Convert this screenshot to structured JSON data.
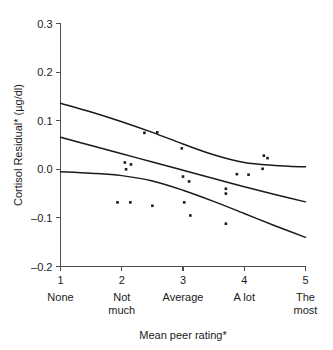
{
  "chart_data": {
    "type": "scatter",
    "title": "",
    "xlabel": "Mean peer rating*",
    "ylabel": "Cortisol Residual* (µg/dl)",
    "xlim": [
      1,
      5
    ],
    "ylim": [
      -0.2,
      0.3
    ],
    "grid": false,
    "legend": "none",
    "x_tick_values": [
      1,
      2,
      3,
      4,
      5
    ],
    "x_tick_labels": [
      "1",
      "2",
      "3",
      "4",
      "5"
    ],
    "x_category_labels": [
      {
        "value": 1,
        "line1": "None",
        "line2": ""
      },
      {
        "value": 2,
        "line1": "Not",
        "line2": "much"
      },
      {
        "value": 3,
        "line1": "Average",
        "line2": ""
      },
      {
        "value": 4,
        "line1": "A lot",
        "line2": ""
      },
      {
        "value": 5,
        "line1": "The",
        "line2": "most"
      }
    ],
    "y_tick_values": [
      -0.2,
      -0.1,
      0.0,
      0.1,
      0.2,
      0.3
    ],
    "y_tick_labels": [
      "–0.2",
      "–0.1",
      "0.0",
      "0.1",
      "0.2",
      "0.3"
    ],
    "points": [
      {
        "x": 1.93,
        "y": -0.068
      },
      {
        "x": 2.05,
        "y": 0.014
      },
      {
        "x": 2.07,
        "y": 0.0
      },
      {
        "x": 2.15,
        "y": 0.01
      },
      {
        "x": 2.14,
        "y": -0.068
      },
      {
        "x": 2.37,
        "y": 0.075
      },
      {
        "x": 2.5,
        "y": -0.075
      },
      {
        "x": 2.58,
        "y": 0.076
      },
      {
        "x": 2.98,
        "y": 0.043
      },
      {
        "x": 3.0,
        "y": -0.015
      },
      {
        "x": 3.02,
        "y": -0.068
      },
      {
        "x": 3.1,
        "y": -0.025
      },
      {
        "x": 3.12,
        "y": -0.095
      },
      {
        "x": 3.7,
        "y": -0.04
      },
      {
        "x": 3.7,
        "y": -0.05
      },
      {
        "x": 3.7,
        "y": -0.112
      },
      {
        "x": 3.88,
        "y": -0.01
      },
      {
        "x": 4.07,
        "y": -0.011
      },
      {
        "x": 4.3,
        "y": 0.001
      },
      {
        "x": 4.32,
        "y": 0.028
      },
      {
        "x": 4.38,
        "y": 0.023
      }
    ],
    "curves": [
      {
        "name": "upper-confidence-band",
        "x": [
          1.0,
          1.5,
          2.0,
          2.5,
          3.0,
          3.5,
          4.0,
          4.5,
          5.0
        ],
        "y": [
          0.136,
          0.118,
          0.098,
          0.076,
          0.052,
          0.03,
          0.014,
          0.008,
          0.005
        ]
      },
      {
        "name": "regression-line",
        "x": [
          1.0,
          1.5,
          2.0,
          2.5,
          3.0,
          3.5,
          4.0,
          4.5,
          5.0
        ],
        "y": [
          0.066,
          0.049,
          0.032,
          0.015,
          -0.002,
          -0.019,
          -0.036,
          -0.052,
          -0.067
        ]
      },
      {
        "name": "lower-confidence-band",
        "x": [
          1.0,
          1.5,
          2.0,
          2.5,
          3.0,
          3.5,
          4.0,
          4.5,
          5.0
        ],
        "y": [
          -0.005,
          -0.008,
          -0.013,
          -0.024,
          -0.043,
          -0.066,
          -0.091,
          -0.116,
          -0.14
        ]
      }
    ],
    "marker": {
      "shape": "square",
      "size_px": 2.6,
      "color": "#1a1a1a"
    },
    "colors": {
      "point": "#1a1a1a",
      "curve": "#1a1a1a",
      "axis": "#4d4d4d"
    }
  }
}
